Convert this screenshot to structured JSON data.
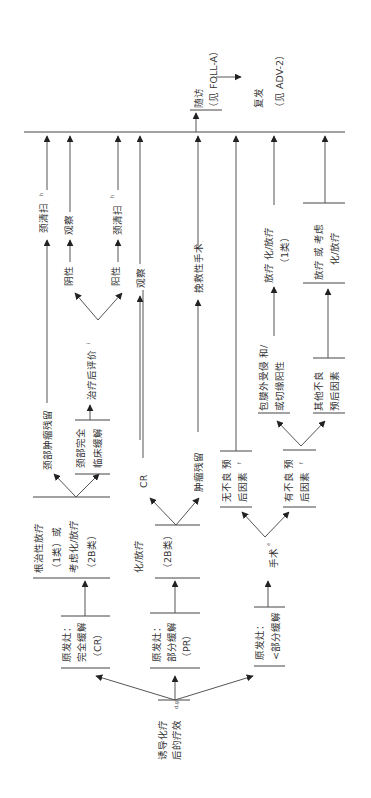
{
  "diagram": {
    "orientation": "rotated-90-ccw",
    "start": {
      "line1": "诱导化疗",
      "line2": "后的疗效",
      "sup": "d,g"
    },
    "responses": [
      {
        "id": "cr",
        "lines": [
          "原发灶：",
          "完全缓解",
          "（CR）"
        ]
      },
      {
        "id": "pr",
        "lines": [
          "原发灶：",
          "部分缓解",
          "（PR）"
        ]
      },
      {
        "id": "lt_pr",
        "lines": [
          "原发灶：",
          "<部分缓解"
        ]
      }
    ],
    "treatments": {
      "cr": {
        "lines": [
          "根治性放疗",
          "（1类）或",
          "考虑化/放疗",
          "（2B类）"
        ]
      },
      "pr": {
        "lines": [
          "化/放疗",
          "（2B类）"
        ]
      },
      "lt_pr": {
        "label": "手术",
        "sup": "e"
      }
    },
    "cr_branch": {
      "neck_residual": "颈部肿瘤残留",
      "neck_residual_action": "颈清扫",
      "neck_residual_action_sup": "h",
      "neck_complete": [
        "颈部完全",
        "临床缓解"
      ],
      "post_eval": "治疗后评价",
      "post_eval_sup": "i",
      "negative": "阴性",
      "negative_action": "观察",
      "positive": "阳性",
      "positive_action": "颈清扫",
      "positive_action_sup": "h"
    },
    "pr_branch": {
      "cr_label": "CR",
      "cr_action": "观察",
      "residual": "肿瘤残留",
      "residual_action": "挽救性手术"
    },
    "surgery_branch": {
      "no_adverse": [
        "无不良 预",
        "后因素"
      ],
      "no_adverse_sup": "f",
      "adverse": [
        "有不良 预",
        "后因素"
      ],
      "adverse_sup": "f",
      "ece": [
        "包膜外受侵 和/",
        "或切缘阳性"
      ],
      "ece_action": [
        "放疗 化/放疗",
        "（1类）"
      ],
      "other": [
        "其他不良",
        "预后因素"
      ],
      "other_action": [
        "放疗 或 考虑",
        "化/放疗"
      ]
    },
    "outcomes": {
      "followup": [
        "随访",
        "（见 FOLL-A）"
      ],
      "recurrence": [
        "复发",
        "（见 ADV-2）"
      ]
    }
  }
}
